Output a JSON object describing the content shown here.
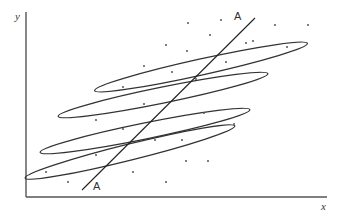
{
  "diagram": {
    "axes": {
      "y_label": "y",
      "x_label": "x"
    },
    "line": {
      "name": "A",
      "label_start": "A",
      "label_end": "A"
    },
    "ellipse_count": 4,
    "colors": {
      "axis": "#555555",
      "ellipse": "#333333",
      "line": "#222222",
      "dot": "#555555"
    }
  }
}
